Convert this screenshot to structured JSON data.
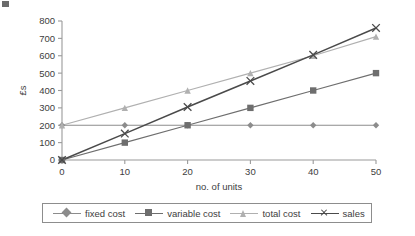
{
  "chart_data": {
    "type": "line",
    "title": "",
    "xlabel": "no. of units",
    "ylabel": "£s",
    "x": [
      0,
      10,
      20,
      30,
      40,
      50
    ],
    "xticks": [
      "0",
      "10",
      "20",
      "30",
      "40",
      "50"
    ],
    "yticks": [
      "0",
      "100",
      "200",
      "300",
      "400",
      "500",
      "600",
      "700",
      "800"
    ],
    "xlim": [
      0,
      50
    ],
    "ylim": [
      0,
      800
    ],
    "grid": false,
    "legend_position": "bottom",
    "series": [
      {
        "name": "fixed cost",
        "values": [
          200,
          200,
          200,
          200,
          200,
          200
        ],
        "color": "#8c8c8c",
        "marker": "diamond"
      },
      {
        "name": "variable cost",
        "values": [
          0,
          100,
          200,
          300,
          400,
          500
        ],
        "color": "#6e6e6e",
        "marker": "square"
      },
      {
        "name": "total cost",
        "values": [
          200,
          300,
          400,
          500,
          600,
          710
        ],
        "color": "#b0b0b0",
        "marker": "triangle"
      },
      {
        "name": "sales",
        "values": [
          0,
          152,
          305,
          455,
          605,
          760
        ],
        "color": "#4a4a4a",
        "marker": "x"
      }
    ]
  },
  "axis": {
    "y_title": "£s",
    "x_title": "no. of units"
  },
  "legend": {
    "items": [
      {
        "label": "fixed cost"
      },
      {
        "label": "variable cost"
      },
      {
        "label": "total cost"
      },
      {
        "label": "sales"
      }
    ]
  }
}
